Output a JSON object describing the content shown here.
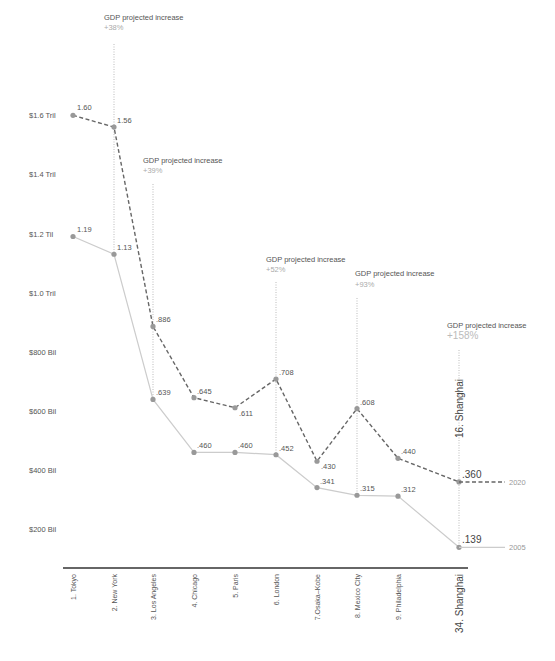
{
  "chart_data": {
    "type": "line",
    "title": "",
    "xlabel": "",
    "ylabel": "GDP",
    "ylim": [
      0,
      1.7
    ],
    "y_ticks": [
      {
        "label": "$1.6 Tril",
        "value": 1.6
      },
      {
        "label": "$1.4 Tril",
        "value": 1.4
      },
      {
        "label": "$1.2 Til",
        "value": 1.2
      },
      {
        "label": "$1.0 Tril",
        "value": 1.0
      },
      {
        "label": "$800 Bil",
        "value": 0.8
      },
      {
        "label": "$600 Bil",
        "value": 0.6
      },
      {
        "label": "$400 Bil",
        "value": 0.4
      },
      {
        "label": "$200 Bil",
        "value": 0.2
      }
    ],
    "categories": [
      "1. Tokyo",
      "2. New York",
      "3. Los Angeles",
      "4. Chicago",
      "5. Paris",
      "6. London",
      "7.Osaka–Kobe",
      "8. Mexico City",
      "9. Philadelphia",
      "34. Shanghai"
    ],
    "series": [
      {
        "name": "2020",
        "style": "dashed",
        "color": "#666666",
        "values": [
          1.6,
          1.56,
          0.886,
          0.645,
          0.611,
          0.708,
          0.43,
          0.608,
          0.44,
          0.36
        ],
        "labels": [
          "1.60",
          "1.56",
          ".886",
          ".645",
          ".611",
          ".708",
          ".430",
          ".608",
          ".440",
          ".360"
        ]
      },
      {
        "name": "2005",
        "style": "solid",
        "color": "#cccccc",
        "values": [
          1.19,
          1.13,
          0.639,
          0.46,
          0.46,
          0.452,
          0.341,
          0.315,
          0.312,
          0.139
        ],
        "labels": [
          "1.19",
          "1.13",
          ".639",
          ".460",
          ".460",
          ".452",
          ".341",
          ".315",
          ".312",
          ".139"
        ]
      }
    ],
    "annotations": [
      {
        "category": "2. New York",
        "title": "GDP projected increase",
        "value": "+38%"
      },
      {
        "category": "3. Los Angeles",
        "title": "GDP projected increase",
        "value": "+39%"
      },
      {
        "category": "6. London",
        "title": "GDP projected increase",
        "value": "+52%"
      },
      {
        "category": "8. Mexico City",
        "title": "GDP projected increase",
        "value": "+93%"
      },
      {
        "category": "34. Shanghai",
        "title": "GDP projected increase",
        "value": "+158%",
        "rank_2020": "16. Shanghai"
      }
    ],
    "legend": {
      "position": "right-inline",
      "entries": [
        "2020",
        "2005"
      ]
    },
    "grid": false
  }
}
